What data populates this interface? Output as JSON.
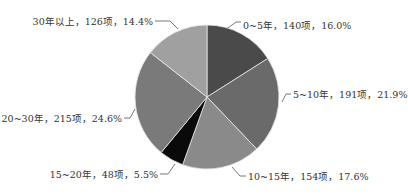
{
  "chart_data": {
    "type": "pie",
    "title": "",
    "start_angle_deg": 0,
    "direction": "clockwise",
    "categories": [
      "0~5年",
      "5~10年",
      "10~15年",
      "15~20年",
      "20~30年",
      "30年以上"
    ],
    "values": [
      140,
      191,
      154,
      48,
      215,
      126
    ],
    "percentages": [
      16.0,
      21.9,
      17.6,
      5.5,
      24.6,
      14.4
    ],
    "unit": "项",
    "colors": [
      "#4a4a4a",
      "#6a6a6a",
      "#8a8a8a",
      "#0a0a0a",
      "#7a7a7a",
      "#a0a0a0"
    ],
    "labels": [
      "0~5年，140项，16.0%",
      "5~10年，191项，21.9%",
      "10~15年，154项，17.6%",
      "15~20年，48项，5.5%",
      "20~30年，215项，24.6%",
      "30年以上，126项，14.4%"
    ],
    "legend": "none"
  }
}
